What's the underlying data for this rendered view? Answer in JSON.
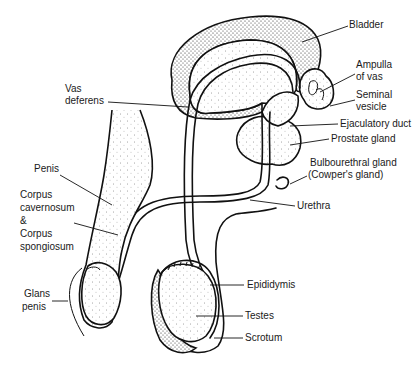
{
  "diagram": {
    "labels": [
      {
        "id": "bladder",
        "text": [
          "Bladder"
        ],
        "x": 349,
        "y": 28,
        "anchor": [
          348,
          26
        ],
        "target": [
          302,
          42
        ]
      },
      {
        "id": "ampulla-of-vas",
        "text": [
          "Ampulla",
          "of vas"
        ],
        "x": 356,
        "y": 68,
        "anchor": [
          355,
          74
        ],
        "target": [
          320,
          92
        ]
      },
      {
        "id": "seminal-vesicle",
        "text": [
          "Seminal",
          "vesicle"
        ],
        "x": 356,
        "y": 96,
        "anchor": [
          355,
          100
        ],
        "target": [
          330,
          106
        ]
      },
      {
        "id": "ejaculatory-duct",
        "text": [
          "Ejaculatory duct"
        ],
        "x": 340,
        "y": 126,
        "anchor": [
          338,
          124
        ],
        "target": [
          290,
          126
        ]
      },
      {
        "id": "prostate-gland",
        "text": [
          "Prostate gland"
        ],
        "x": 331,
        "y": 141,
        "anchor": [
          329,
          139
        ],
        "target": [
          290,
          145
        ]
      },
      {
        "id": "bulbourethral-gland",
        "text": [
          "Bulbourethral gland",
          "(Cowper's gland)"
        ],
        "x": 310,
        "y": 165,
        "anchor": [
          307,
          176
        ],
        "target": [
          290,
          184
        ]
      },
      {
        "id": "urethra",
        "text": [
          "Urethra"
        ],
        "x": 297,
        "y": 209,
        "anchor": [
          295,
          206
        ],
        "target": [
          250,
          200
        ]
      },
      {
        "id": "vas-deferens",
        "text": [
          "Vas",
          "deferens"
        ],
        "x": 65,
        "y": 92,
        "anchor": [
          108,
          102
        ],
        "target": [
          188,
          107
        ]
      },
      {
        "id": "penis",
        "text": [
          "Penis"
        ],
        "x": 34,
        "y": 172,
        "anchor": [
          60,
          175
        ],
        "target": [
          112,
          205
        ]
      },
      {
        "id": "corpus",
        "text": [
          "Corpus",
          "cavernosum",
          "&",
          "Corpus",
          "spongiosum"
        ],
        "x": 20,
        "y": 198,
        "anchor": [
          74,
          223
        ],
        "target": [
          118,
          235
        ]
      },
      {
        "id": "glans-penis",
        "text": [
          "Glans",
          "penis"
        ],
        "x": 24,
        "y": 295,
        "anchor": [
          52,
          301
        ],
        "target": [
          68,
          301
        ]
      },
      {
        "id": "epididymis",
        "text": [
          "Epididymis"
        ],
        "x": 247,
        "y": 288,
        "anchor": [
          244,
          285
        ],
        "target": [
          210,
          285
        ]
      },
      {
        "id": "testes",
        "text": [
          "Testes"
        ],
        "x": 245,
        "y": 319,
        "anchor": [
          243,
          316
        ],
        "target": [
          196,
          316
        ]
      },
      {
        "id": "scrotum",
        "text": [
          "Scrotum"
        ],
        "x": 245,
        "y": 341,
        "anchor": [
          243,
          338
        ],
        "target": [
          214,
          338
        ]
      }
    ]
  }
}
